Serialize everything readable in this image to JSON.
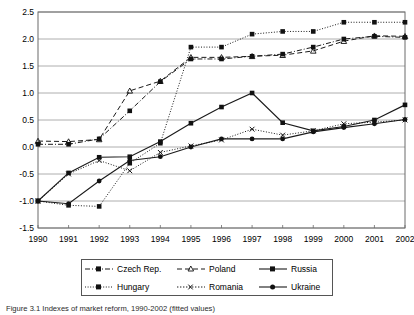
{
  "chart_data": {
    "type": "line",
    "title": "",
    "xlabel": "",
    "ylabel": "",
    "x": [
      1990,
      1991,
      1992,
      1993,
      1994,
      1995,
      1996,
      1997,
      1998,
      1999,
      2000,
      2001,
      2002
    ],
    "categories": [
      "1990",
      "1991",
      "1992",
      "1993",
      "1994",
      "1995",
      "1996",
      "1997",
      "1998",
      "1999",
      "2000",
      "2001",
      "2002"
    ],
    "xlim": [
      1990,
      2002
    ],
    "ylim": [
      -1.5,
      2.5
    ],
    "yticks": [
      -1.5,
      -1.0,
      -0.5,
      0.0,
      0.5,
      1.0,
      1.5,
      2.0,
      2.5
    ],
    "ytick_labels": [
      "-1.5",
      "-1.0",
      "-0.5",
      "0.0",
      "0.5",
      "1.0",
      "1.5",
      "2.0",
      "2.5"
    ],
    "grid": "horizontal",
    "legend_position": "bottom-center",
    "series": [
      {
        "name": "Czech Rep.",
        "marker": "square",
        "dash": "dashdot",
        "values": [
          0.05,
          0.05,
          0.15,
          0.67,
          1.21,
          1.63,
          1.63,
          1.68,
          1.72,
          1.85,
          2.0,
          2.05,
          2.03
        ]
      },
      {
        "name": "Hungary",
        "marker": "square",
        "dash": "dotted",
        "values": [
          -1.0,
          -1.08,
          -1.1,
          -0.3,
          0.07,
          1.85,
          1.85,
          2.09,
          2.14,
          2.14,
          2.31,
          2.31,
          2.31
        ]
      },
      {
        "name": "Poland",
        "marker": "triangle",
        "dash": "dashed",
        "values": [
          0.11,
          0.1,
          0.14,
          1.04,
          1.22,
          1.66,
          1.66,
          1.68,
          1.7,
          1.78,
          1.96,
          2.06,
          2.05
        ]
      },
      {
        "name": "Romania",
        "marker": "x",
        "dash": "dotted",
        "values": [
          -1.0,
          -0.5,
          -0.25,
          -0.44,
          -0.1,
          0.02,
          0.13,
          0.33,
          0.22,
          0.3,
          0.43,
          0.46,
          0.5
        ]
      },
      {
        "name": "Russia",
        "marker": "square",
        "dash": "solid",
        "values": [
          -1.0,
          -0.48,
          -0.19,
          -0.18,
          0.1,
          0.44,
          0.74,
          1.0,
          0.45,
          0.3,
          0.38,
          0.5,
          0.78
        ]
      },
      {
        "name": "Ukraine",
        "marker": "circle",
        "dash": "solid",
        "values": [
          -1.0,
          -1.05,
          -0.63,
          -0.25,
          -0.18,
          0.0,
          0.15,
          0.15,
          0.15,
          0.28,
          0.36,
          0.43,
          0.51
        ]
      }
    ]
  },
  "legend": {
    "entries": [
      {
        "label": "Czech Rep.",
        "slot": "r1c1"
      },
      {
        "label": "Poland",
        "slot": "r1c2"
      },
      {
        "label": "Russia",
        "slot": "r1c3"
      },
      {
        "label": "Hungary",
        "slot": "r2c1"
      },
      {
        "label": "Romania",
        "slot": "r2c2"
      },
      {
        "label": "Ukraine",
        "slot": "r2c3"
      }
    ]
  },
  "caption": {
    "text": "Figure 3.1  Indexes of market reform, 1990-2002 (fitted values)"
  },
  "colors": {
    "line": "#1a1a1a",
    "grid": "#9a9a9a",
    "frame": "#6b6b6b",
    "text": "#000000"
  }
}
